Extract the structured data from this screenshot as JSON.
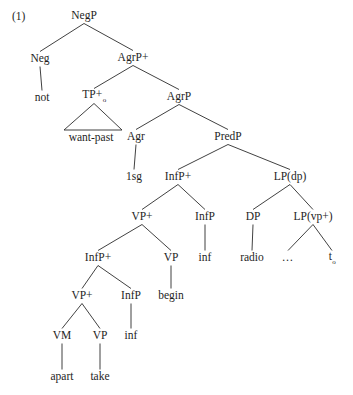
{
  "figure": {
    "example_number": "(1)",
    "type": "syntax-tree",
    "background_color": "#ffffff",
    "line_color": "#2b2b2b",
    "text_color": "#1e1e1e"
  },
  "nodes": [
    {
      "id": "negp",
      "label": "NegP",
      "sub": "",
      "x": 84,
      "y": 16,
      "kind": "nonterminal"
    },
    {
      "id": "neg",
      "label": "Neg",
      "sub": "",
      "x": 40,
      "y": 59,
      "kind": "nonterminal"
    },
    {
      "id": "not",
      "label": "not",
      "sub": "",
      "x": 42,
      "y": 98,
      "kind": "terminal"
    },
    {
      "id": "agrp_plus",
      "label": "AgrP+",
      "sub": "",
      "x": 133,
      "y": 58,
      "kind": "nonterminal"
    },
    {
      "id": "tp_plus",
      "label": "TP+",
      "sub": "o",
      "x": 94,
      "y": 96,
      "kind": "nonterminal"
    },
    {
      "id": "want_past",
      "label": "want-past",
      "sub": "",
      "x": 91,
      "y": 138,
      "kind": "terminal"
    },
    {
      "id": "agrp",
      "label": "AgrP",
      "sub": "",
      "x": 179,
      "y": 97,
      "kind": "nonterminal"
    },
    {
      "id": "agr",
      "label": "Agr",
      "sub": "",
      "x": 136,
      "y": 137,
      "kind": "nonterminal"
    },
    {
      "id": "onesg",
      "label": "1sg",
      "sub": "",
      "x": 134,
      "y": 177,
      "kind": "terminal"
    },
    {
      "id": "predp",
      "label": "PredP",
      "sub": "",
      "x": 228,
      "y": 137,
      "kind": "nonterminal"
    },
    {
      "id": "infp_plus1",
      "label": "InfP+",
      "sub": "",
      "x": 178,
      "y": 177,
      "kind": "nonterminal"
    },
    {
      "id": "vp_plus1",
      "label": "VP+",
      "sub": "",
      "x": 142,
      "y": 217,
      "kind": "nonterminal"
    },
    {
      "id": "infp_plus2",
      "label": "InfP+",
      "sub": "",
      "x": 98,
      "y": 258,
      "kind": "nonterminal"
    },
    {
      "id": "vp_plus2",
      "label": "VP+",
      "sub": "",
      "x": 82,
      "y": 296,
      "kind": "nonterminal"
    },
    {
      "id": "vm",
      "label": "VM",
      "sub": "",
      "x": 62,
      "y": 336,
      "kind": "nonterminal"
    },
    {
      "id": "apart",
      "label": "apart",
      "sub": "",
      "x": 62,
      "y": 377,
      "kind": "terminal"
    },
    {
      "id": "vp_take",
      "label": "VP",
      "sub": "",
      "x": 100,
      "y": 336,
      "kind": "nonterminal"
    },
    {
      "id": "take",
      "label": "take",
      "sub": "",
      "x": 100,
      "y": 377,
      "kind": "terminal"
    },
    {
      "id": "infp2",
      "label": "InfP",
      "sub": "",
      "x": 131,
      "y": 296,
      "kind": "nonterminal"
    },
    {
      "id": "inf2",
      "label": "inf",
      "sub": "",
      "x": 131,
      "y": 336,
      "kind": "terminal"
    },
    {
      "id": "vp_begin",
      "label": "VP",
      "sub": "",
      "x": 171,
      "y": 258,
      "kind": "nonterminal"
    },
    {
      "id": "begin",
      "label": "begin",
      "sub": "",
      "x": 171,
      "y": 296,
      "kind": "terminal"
    },
    {
      "id": "infp1",
      "label": "InfP",
      "sub": "",
      "x": 205,
      "y": 217,
      "kind": "nonterminal"
    },
    {
      "id": "inf1",
      "label": "inf",
      "sub": "",
      "x": 205,
      "y": 258,
      "kind": "terminal"
    },
    {
      "id": "lp_dp",
      "label": "LP(dp)",
      "sub": "",
      "x": 290,
      "y": 177,
      "kind": "nonterminal"
    },
    {
      "id": "dp",
      "label": "DP",
      "sub": "",
      "x": 253,
      "y": 217,
      "kind": "nonterminal"
    },
    {
      "id": "radio",
      "label": "radio",
      "sub": "",
      "x": 252,
      "y": 258,
      "kind": "terminal"
    },
    {
      "id": "lp_vp",
      "label": "LP(vp+)",
      "sub": "",
      "x": 313,
      "y": 217,
      "kind": "nonterminal"
    },
    {
      "id": "ellipsis",
      "label": "…",
      "sub": "",
      "x": 288,
      "y": 258,
      "kind": "terminal"
    },
    {
      "id": "trace",
      "label": "t",
      "sub": "o",
      "x": 332,
      "y": 258,
      "kind": "terminal"
    }
  ],
  "edges": [
    {
      "from": "negp",
      "to": "neg"
    },
    {
      "from": "negp",
      "to": "agrp_plus"
    },
    {
      "from": "neg",
      "to": "not"
    },
    {
      "from": "agrp_plus",
      "to": "tp_plus"
    },
    {
      "from": "agrp_plus",
      "to": "agrp"
    },
    {
      "from": "agrp",
      "to": "agr"
    },
    {
      "from": "agrp",
      "to": "predp"
    },
    {
      "from": "agr",
      "to": "onesg"
    },
    {
      "from": "predp",
      "to": "infp_plus1"
    },
    {
      "from": "predp",
      "to": "lp_dp"
    },
    {
      "from": "infp_plus1",
      "to": "vp_plus1"
    },
    {
      "from": "infp_plus1",
      "to": "infp1"
    },
    {
      "from": "infp1",
      "to": "inf1"
    },
    {
      "from": "vp_plus1",
      "to": "infp_plus2"
    },
    {
      "from": "vp_plus1",
      "to": "vp_begin"
    },
    {
      "from": "vp_begin",
      "to": "begin"
    },
    {
      "from": "infp_plus2",
      "to": "vp_plus2"
    },
    {
      "from": "infp_plus2",
      "to": "infp2"
    },
    {
      "from": "infp2",
      "to": "inf2"
    },
    {
      "from": "vp_plus2",
      "to": "vm"
    },
    {
      "from": "vp_plus2",
      "to": "vp_take"
    },
    {
      "from": "vm",
      "to": "apart"
    },
    {
      "from": "vp_take",
      "to": "take"
    },
    {
      "from": "lp_dp",
      "to": "dp"
    },
    {
      "from": "lp_dp",
      "to": "lp_vp"
    },
    {
      "from": "dp",
      "to": "radio"
    },
    {
      "from": "lp_vp",
      "to": "ellipsis"
    },
    {
      "from": "lp_vp",
      "to": "trace"
    }
  ],
  "triangles": [
    {
      "id": "tp-triangle",
      "parent": "tp_plus",
      "left_x": 64,
      "right_x": 122,
      "base_y": 130
    }
  ]
}
